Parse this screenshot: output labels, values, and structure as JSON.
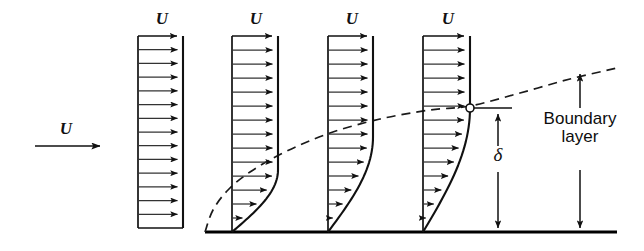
{
  "figure": {
    "colors": {
      "ink": "#111111",
      "wall": "#000000",
      "dashed": "#1a1a1a",
      "background": "#ffffff"
    }
  },
  "freestream": {
    "label": "U",
    "arrow": {
      "x1": 35,
      "y1": 146,
      "x2": 107,
      "y2": 146
    },
    "label_pos": {
      "x": 66,
      "y": 120
    }
  },
  "wall": {
    "name": "flat-plate-surface",
    "y": 232,
    "x1": 205,
    "x2": 617
  },
  "profiles": [
    {
      "name": "velocity-profile-1",
      "label": "U",
      "axis_x": 138,
      "top_y": 36,
      "bottom_y": 228,
      "tip_x": 183,
      "delta": 0,
      "n_arrows": 13,
      "label_pos": {
        "x": 162,
        "y": 10
      }
    },
    {
      "name": "velocity-profile-2",
      "label": "U",
      "axis_x": 232,
      "top_y": 36,
      "bottom_y": 232,
      "tip_x": 278,
      "delta": 62,
      "n_arrows": 13,
      "label_pos": {
        "x": 256,
        "y": 10
      }
    },
    {
      "name": "velocity-profile-3",
      "label": "U",
      "axis_x": 328,
      "top_y": 36,
      "bottom_y": 232,
      "tip_x": 373,
      "delta": 95,
      "n_arrows": 13,
      "label_pos": {
        "x": 352,
        "y": 10
      }
    },
    {
      "name": "velocity-profile-4",
      "label": "U",
      "axis_x": 423,
      "top_y": 36,
      "bottom_y": 232,
      "tip_x": 470,
      "delta": 124,
      "n_arrows": 13,
      "label_pos": {
        "x": 448,
        "y": 10
      }
    }
  ],
  "edge_curve": {
    "name": "boundary-layer-edge-dashed-line",
    "style": "dashed",
    "points": [
      [
        205,
        232
      ],
      [
        213,
        210
      ],
      [
        228,
        190
      ],
      [
        250,
        172
      ],
      [
        285,
        152
      ],
      [
        330,
        133
      ],
      [
        380,
        119
      ],
      [
        430,
        110
      ],
      [
        470,
        106
      ],
      [
        520,
        93
      ],
      [
        570,
        79
      ],
      [
        617,
        68
      ]
    ]
  },
  "marker": {
    "name": "boundary-layer-edge-point",
    "x": 470,
    "y": 108,
    "r": 4,
    "style": "open-circle"
  },
  "delta_dim": {
    "label": "δ",
    "x": 498,
    "y_top": 112,
    "y_bottom": 232,
    "label_pos": {
      "x": 498,
      "y": 158
    },
    "tick": {
      "x1": 474,
      "x2": 512,
      "y": 108
    }
  },
  "boundary_layer_dim": {
    "label_line1": "Boundary",
    "label_line2": "layer",
    "x": 580,
    "y_top": 72,
    "y_bottom": 232,
    "gap_top": 118,
    "gap_bottom": 168,
    "label_pos": {
      "x": 580,
      "y": 118
    }
  }
}
